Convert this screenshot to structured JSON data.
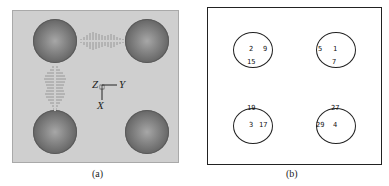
{
  "panel_a": {
    "caption": "(a)",
    "background": "#cfcfcf",
    "spheres": [
      {
        "id": "top-left"
      },
      {
        "id": "top-right"
      },
      {
        "id": "bottom-left"
      },
      {
        "id": "bottom-right"
      }
    ],
    "axes": {
      "z": "Z",
      "y": "Y",
      "x": "X"
    }
  },
  "panel_b": {
    "caption": "(b)",
    "circles": [
      {
        "id": "top-left",
        "labels": [
          "2",
          "9",
          "15"
        ]
      },
      {
        "id": "top-right",
        "labels": [
          "5",
          "1",
          "7"
        ]
      },
      {
        "id": "bottom-left",
        "labels": [
          "19",
          "3",
          "17"
        ]
      },
      {
        "id": "bottom-right",
        "labels": [
          "27",
          "29",
          "4"
        ]
      }
    ]
  }
}
